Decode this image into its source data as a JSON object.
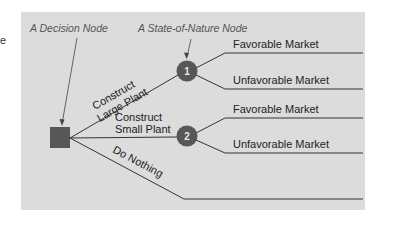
{
  "diagram": {
    "edge_fragment": "e",
    "callouts": {
      "decision_node": "A Decision Node",
      "state_of_nature_node": "A State-of-Nature Node"
    },
    "decision_node": {
      "shape": "square",
      "color": "#575757"
    },
    "branches": {
      "large_plant": {
        "line1": "Construct",
        "line2": "Large Plant"
      },
      "small_plant": {
        "line1": "Construct",
        "line2": "Small Plant"
      },
      "do_nothing": "Do Nothing"
    },
    "chance_nodes": [
      {
        "number": "1",
        "outcomes": [
          "Favorable Market",
          "Unfavorable Market"
        ]
      },
      {
        "number": "2",
        "outcomes": [
          "Favorable Market",
          "Unfavorable Market"
        ]
      }
    ],
    "colors": {
      "panel": "#dcdcdc",
      "node": "#575757",
      "line": "#333333",
      "callout_text": "#555555"
    }
  }
}
